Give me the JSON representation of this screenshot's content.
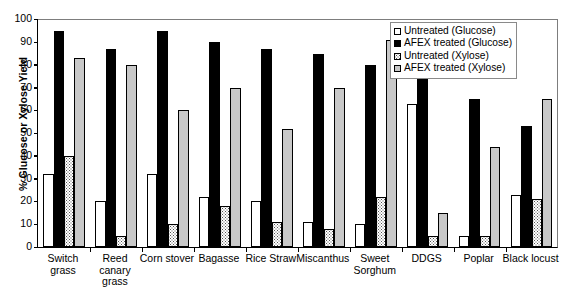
{
  "chart_data": {
    "type": "bar",
    "title": "",
    "xlabel": "",
    "ylabel": "% Glucose or Xylose Yield",
    "ylim": [
      0,
      100
    ],
    "yticks": [
      0,
      10,
      20,
      30,
      40,
      50,
      60,
      70,
      80,
      90,
      100
    ],
    "grid": false,
    "legend_position": "top-right",
    "categories": [
      "Switch grass",
      "Reed canary grass",
      "Corn stover",
      "Bagasse",
      "Rice Straw",
      "Miscanthus",
      "Sweet Sorghum",
      "DDGS",
      "Poplar",
      "Black locust"
    ],
    "category_lines": [
      [
        "Switch",
        "grass"
      ],
      [
        "Reed",
        "canary",
        "grass"
      ],
      [
        "Corn stover"
      ],
      [
        "Bagasse"
      ],
      [
        "Rice Straw"
      ],
      [
        "Miscanthus"
      ],
      [
        "Sweet",
        "Sorghum"
      ],
      [
        "DDGS"
      ],
      [
        "Poplar"
      ],
      [
        "Black locust"
      ]
    ],
    "series": [
      {
        "name": "Untreated (Glucose)",
        "key": "s-ug",
        "color": "#ffffff",
        "values": [
          32,
          20,
          32,
          22,
          20,
          11,
          10,
          63,
          5,
          23
        ]
      },
      {
        "name": "AFEX treated (Glucose)",
        "key": "s-ag",
        "color": "#000000",
        "values": [
          95,
          87,
          95,
          90,
          87,
          85,
          80,
          85,
          65,
          53
        ]
      },
      {
        "name": "Untreated (Xylose)",
        "key": "s-ux",
        "color": "#ffffff",
        "values": [
          40,
          5,
          10,
          18,
          11,
          8,
          22,
          5,
          5,
          21
        ]
      },
      {
        "name": "AFEX treated (Xylose)",
        "key": "s-ax",
        "color": "#c8c8c8",
        "values": [
          83,
          80,
          60,
          70,
          52,
          70,
          91,
          15,
          44,
          65
        ]
      }
    ]
  }
}
